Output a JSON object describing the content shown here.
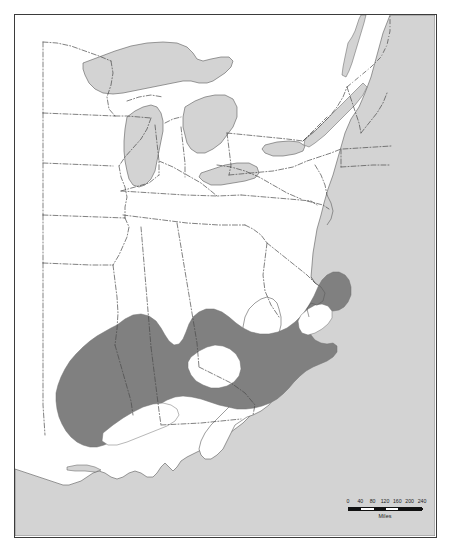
{
  "figure": {
    "type": "species-distribution-map",
    "region": "Eastern United States",
    "frame": {
      "border_color": "#3b3b3b"
    }
  },
  "legend": {
    "range_fill_color": "#808080",
    "water_fill_color": "#d3d3d3",
    "land_fill_color": "#ffffff",
    "boundary_color": "#4a4a4a"
  },
  "scale_bar": {
    "ticks": [
      "0",
      "40",
      "80",
      "120",
      "160",
      "200",
      "240"
    ],
    "unit_label": "Miles",
    "max_value": 240,
    "interval": 40
  },
  "map_features": {
    "water_bodies": [
      "Atlantic Ocean",
      "Gulf of Mexico",
      "Lake Superior",
      "Lake Michigan",
      "Lake Huron",
      "Lake Erie",
      "Lake Ontario",
      "Lake Champlain",
      "Lake Okeechobee",
      "Chesapeake Bay"
    ],
    "shaded_range_description": "Continuous shaded distribution band across the southeastern United States, extending from eastern Texas and Louisiana east through Mississippi, Alabama, Georgia and the Carolinas to the Virginia coast, with unshaded gaps in central Alabama/Georgia and the inner Coastal Plain"
  }
}
